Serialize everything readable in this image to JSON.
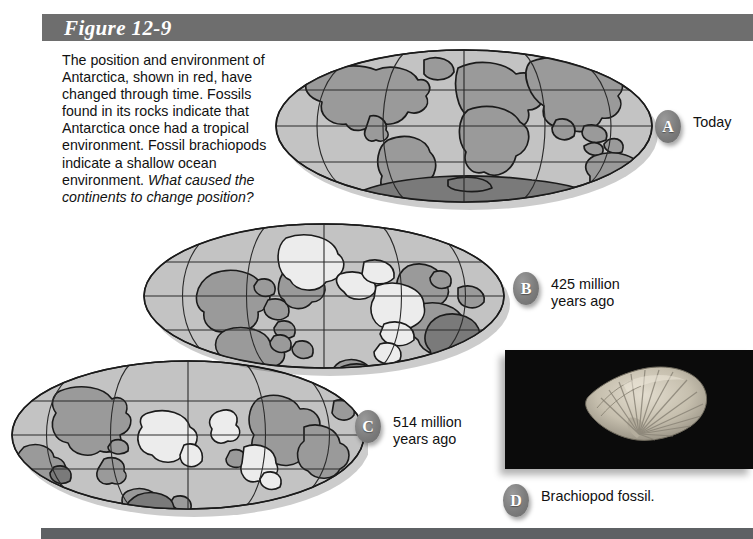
{
  "figure": {
    "title": "Figure 12-9",
    "title_bar_color": "#6e6e6e",
    "caption_main": "The position and environment of Antarctica, shown in red, have changed through time. Fossils found in its rocks indicate that Antarctica once had a tropical environment. Fossil brachiopods indicate a shallow ocean environment. ",
    "caption_question": "What caused the continents to change position?"
  },
  "callouts": [
    {
      "badge": "A",
      "label": "Today"
    },
    {
      "badge": "B",
      "label": "425 million\nyears ago"
    },
    {
      "badge": "C",
      "label": "514 million\nyears ago"
    },
    {
      "badge": "D",
      "label": "Brachiopod fossil."
    }
  ],
  "globes": [
    {
      "id": "globe-a",
      "era": "Today"
    },
    {
      "id": "globe-b",
      "era": "425 million years ago"
    },
    {
      "id": "globe-c",
      "era": "514 million years ago"
    }
  ],
  "photo": {
    "subject": "brachiopod-fossil",
    "background_color": "#0b0b0b",
    "specimen_color": "#c9c2b2"
  },
  "colors": {
    "ocean": "#c3c3c3",
    "land": "#9a9a9a",
    "antarctica": "#7a7a7a",
    "shallow_sea": "#e9e9e9",
    "outline": "#1b1b1b",
    "graticule": "#2b2b2b",
    "badge": "#7c7c7c",
    "bottom_bar": "#5e6164"
  }
}
